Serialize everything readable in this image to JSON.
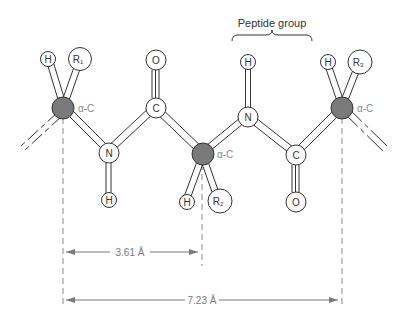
{
  "diagram": {
    "title": "Peptide group",
    "colors": {
      "alpha_carbon_fill": "#7a7a7a",
      "atom_stroke": "#333333",
      "atom_fill": "#ffffff",
      "dim_line": "#7a7a7a",
      "alpha_label": "#8a8a8a"
    },
    "atoms": [
      {
        "id": "ac1",
        "label": "",
        "type": "alpha-carbon",
        "note": "α-C"
      },
      {
        "id": "h1",
        "label": "H"
      },
      {
        "id": "r1",
        "label": "R",
        "sub": "1"
      },
      {
        "id": "n1",
        "label": "N"
      },
      {
        "id": "hn1",
        "label": "H"
      },
      {
        "id": "c1",
        "label": "C"
      },
      {
        "id": "o1",
        "label": "O"
      },
      {
        "id": "ac2",
        "label": "",
        "type": "alpha-carbon",
        "note": "α-C"
      },
      {
        "id": "h2",
        "label": "H"
      },
      {
        "id": "r2",
        "label": "R",
        "sub": "2"
      },
      {
        "id": "n2",
        "label": "N"
      },
      {
        "id": "hn2",
        "label": "H"
      },
      {
        "id": "c2",
        "label": "C"
      },
      {
        "id": "o2",
        "label": "O"
      },
      {
        "id": "ac3",
        "label": "",
        "type": "alpha-carbon",
        "note": "α-C"
      },
      {
        "id": "h3",
        "label": "H"
      },
      {
        "id": "r3",
        "label": "R",
        "sub": "3"
      }
    ],
    "alpha_label": "α-C",
    "dimensions": [
      {
        "id": "short",
        "label": "3.61 Å"
      },
      {
        "id": "long",
        "label": "7.23 Å"
      }
    ]
  }
}
